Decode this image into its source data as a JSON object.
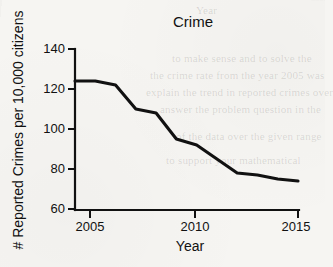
{
  "chart_data": {
    "type": "line",
    "title": "Crime",
    "xlabel": "Year",
    "ylabel": "# Reported Crimes per 10,000 citizens",
    "x": [
      2004,
      2005,
      2006,
      2007,
      2008,
      2009,
      2010,
      2011,
      2012,
      2013,
      2014,
      2015
    ],
    "values": [
      124,
      124,
      122,
      110,
      108,
      95,
      92,
      85,
      78,
      77,
      75,
      74
    ],
    "series": [
      {
        "name": "Reported crimes per 10,000 citizens",
        "values": [
          124,
          124,
          122,
          110,
          108,
          95,
          92,
          85,
          78,
          77,
          75,
          74
        ]
      }
    ],
    "xlim": [
      2004,
      2015
    ],
    "ylim": [
      60,
      140
    ],
    "xticks": [
      2005,
      2010,
      2015
    ],
    "xtick_labels": [
      "2005",
      "2010",
      "2015"
    ],
    "yticks": [
      60,
      80,
      100,
      120,
      140
    ],
    "ytick_labels": [
      "60",
      "80",
      "100",
      "120",
      "140"
    ],
    "grid": false,
    "legend": false,
    "line_color": "#111111"
  },
  "page": {
    "background_color": "#f6f5f2",
    "ink_color": "#111111"
  },
  "ghost_text": {
    "lines": [
      "Year",
      "to make sense and to solve the",
      "the crime rate from the year 2005 was",
      "explain the trend in reported crimes over",
      "answer the problem question in the",
      "of the data over the given range",
      "to support your mathematical"
    ]
  }
}
